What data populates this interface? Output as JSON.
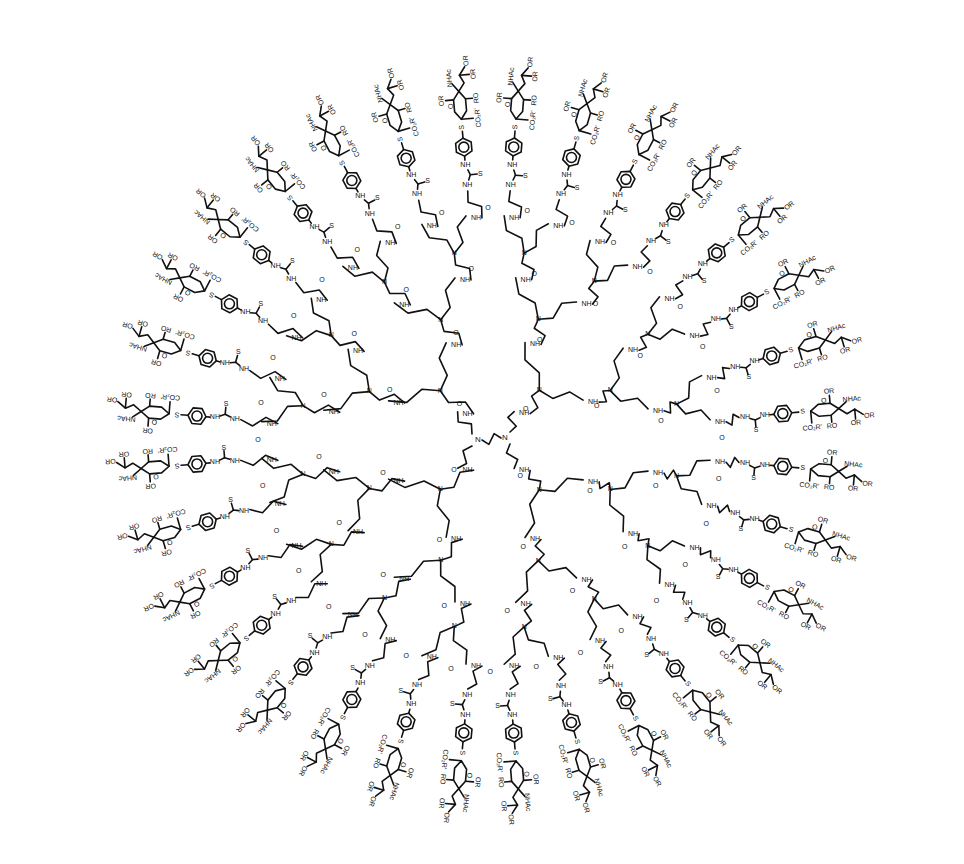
{
  "diagram": {
    "type": "chemical-structure",
    "core": {
      "labels": [
        "N",
        "N"
      ],
      "description": "ethylenediamine core"
    },
    "branch_labels": {
      "amine": "N",
      "amide_nh": "NH",
      "carbonyl_o": "O",
      "hn": "HN"
    },
    "linker_labels": {
      "thiourea_s": "S",
      "thiourea_nh": "NH",
      "thiourea_hn": "HN",
      "thioether_s": "S"
    },
    "sugar_labels": {
      "ring_o": "O",
      "or": "OR",
      "ro": "RO",
      "nhac": "NHAc",
      "achn": "AcHN",
      "ester": "CO₂R'",
      "ester_rev": "R'O₂C"
    },
    "terminal_count": 32,
    "colors": {
      "ink": "#111111",
      "background": "#ffffff"
    }
  }
}
